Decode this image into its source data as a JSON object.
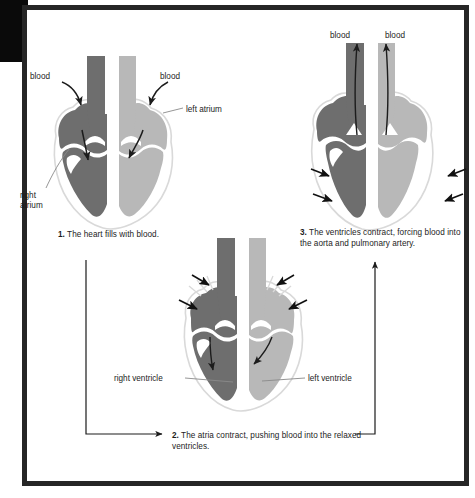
{
  "figure": {
    "colors": {
      "deoxygenated_chamber": "#6e6e6e",
      "oxygenated_chamber": "#b8b8b8",
      "heart_outline": "#d8d8d8",
      "vessel_dark": "#6e6e6e",
      "vessel_light": "#b8b8b8",
      "arrow": "#1c1c1c",
      "text": "#1c1c1c",
      "frame": "#262626",
      "corner_block": "#0a0a0a",
      "background": "#ffffff"
    },
    "steps": [
      {
        "number": "1.",
        "text": "The heart fills with blood.",
        "labels": [
          {
            "name": "blood-left",
            "text": "blood"
          },
          {
            "name": "blood-right",
            "text": "blood"
          },
          {
            "name": "left-atrium",
            "text": "left atrium"
          },
          {
            "name": "right-atrium",
            "text": "right\natrium"
          }
        ]
      },
      {
        "number": "2.",
        "text": "The atria contract, pushing blood into the relaxed ventricles.",
        "labels": [
          {
            "name": "right-ventricle",
            "text": "right ventricle"
          },
          {
            "name": "left-ventricle",
            "text": "left ventricle"
          }
        ]
      },
      {
        "number": "3.",
        "text": "The ventricles contract, forcing blood into the aorta and pulmonary artery.",
        "labels": [
          {
            "name": "blood-left",
            "text": "blood"
          },
          {
            "name": "blood-right",
            "text": "blood"
          }
        ]
      }
    ],
    "captions": {
      "step1": "1. The heart fills with blood.",
      "step1_num": "1.",
      "step1_body": " The heart fills with blood.",
      "step2_num": "2.",
      "step2_body": " The atria contract, pushing blood into the relaxed ventricles.",
      "step3_num": "3.",
      "step3_body": " The ventricles contract, forcing blood into the aorta and pulmonary artery."
    },
    "labels": {
      "blood": "blood",
      "left_atrium": "left atrium",
      "right_atrium": "right\natrium",
      "right_ventricle": "right ventricle",
      "left_ventricle": "left ventricle"
    }
  }
}
